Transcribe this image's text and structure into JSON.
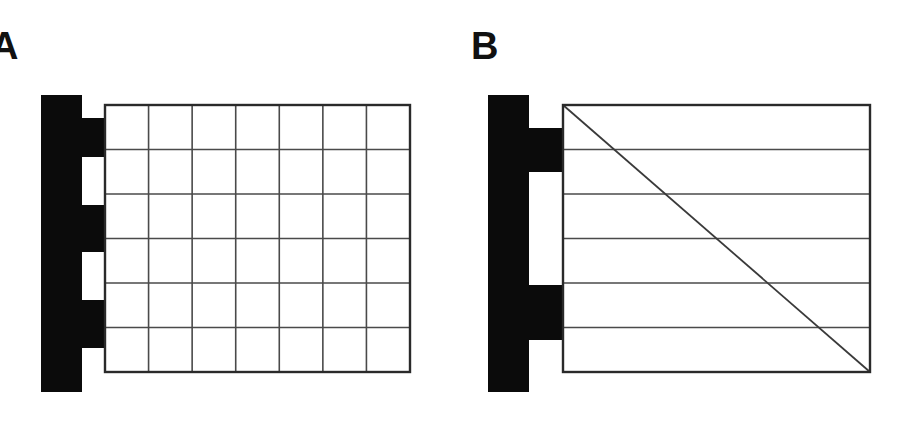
{
  "figure": {
    "background_color": "#ffffff",
    "width": 900,
    "height": 444,
    "ink_color": "#0b0b0b",
    "line_color": "#3a3a3a"
  },
  "panels": [
    {
      "id": "a",
      "label": "A",
      "clamp": {
        "name": "clamp-bracket",
        "fill": "#0b0b0b",
        "bar_left": 41,
        "bar_right": 82,
        "bar_top": 95,
        "bar_bottom": 392,
        "tab_right": 105,
        "tab_top": 118,
        "tab_bottom": 348,
        "notch_count": 2,
        "notches": [
          {
            "top": 157,
            "bottom": 205
          },
          {
            "top": 252,
            "bottom": 300
          }
        ]
      },
      "grid": {
        "name": "grid-panel-a",
        "left": 105,
        "top": 105,
        "right": 410,
        "bottom": 372,
        "columns": 7,
        "rows": 6,
        "has_vertical_lines": true,
        "has_horizontal_lines": true,
        "has_diagonal": false,
        "cell_fill": "#ffffff",
        "border_color": "#2a2a2a",
        "grid_line_color": "#4a4a4a"
      }
    },
    {
      "id": "b",
      "label": "B",
      "clamp": {
        "name": "clamp-bracket",
        "fill": "#0b0b0b",
        "bar_left": 38,
        "bar_right": 79,
        "bar_top": 95,
        "bar_bottom": 392,
        "tab_right": 113,
        "tab_top": 128,
        "tab_bottom": 340,
        "notch_count": 1,
        "notches": [
          {
            "top": 172,
            "bottom": 285
          }
        ]
      },
      "grid": {
        "name": "grid-panel-b",
        "left": 113,
        "top": 105,
        "right": 420,
        "bottom": 372,
        "columns": 1,
        "rows": 6,
        "has_vertical_lines": false,
        "has_horizontal_lines": true,
        "has_diagonal": true,
        "diagonal_from": "top-left",
        "diagonal_to": "bottom-right",
        "cell_fill": "#ffffff",
        "border_color": "#2a2a2a",
        "grid_line_color": "#4a4a4a"
      }
    }
  ]
}
